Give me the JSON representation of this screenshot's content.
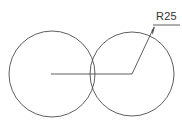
{
  "drawing": {
    "title": "R25 two-circle construction drawing",
    "background_color": "#ffffff",
    "line_color": "#4d4d4d",
    "text_color": "#333333",
    "line_width": 0.9,
    "canvas": {
      "width": 182,
      "height": 134
    },
    "annotations": {
      "radius_label": "R25"
    },
    "geometry": {
      "left_circle": {
        "cx": 52,
        "cy": 74,
        "r": 43
      },
      "right_circle": {
        "cx": 132,
        "cy": 74,
        "r": 42
      },
      "centerline": {
        "x1": 51,
        "y1": 74,
        "x2": 132,
        "y2": 74
      },
      "leader_diagonal": {
        "x1": 132,
        "y1": 74,
        "x2": 154,
        "y2": 27
      },
      "leader_shelf": {
        "x1": 154,
        "y1": 25,
        "x2": 180,
        "y2": 25
      },
      "arrow_tip": {
        "x": 155,
        "y": 25
      },
      "label_position": {
        "x": 156,
        "y": 20
      }
    }
  }
}
